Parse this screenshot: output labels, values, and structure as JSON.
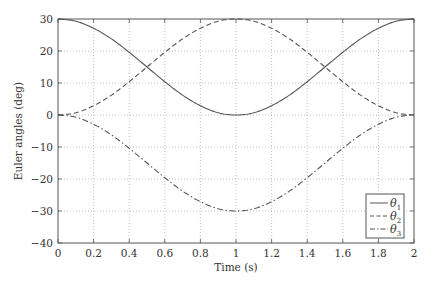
{
  "chart_data": {
    "type": "line",
    "title": "",
    "xlabel": "Time (s)",
    "ylabel": "Euler angles (deg)",
    "xlim": [
      0,
      2
    ],
    "ylim": [
      -40,
      30
    ],
    "grid": true,
    "legend_position": "lower right",
    "xticks": [
      0,
      0.2,
      0.4,
      0.6,
      0.8,
      1,
      1.2,
      1.4,
      1.6,
      1.8,
      2
    ],
    "xtick_labels": [
      "0",
      "0.2",
      "0.4",
      "0.6",
      "0.8",
      "1",
      "1.2",
      "1.4",
      "1.6",
      "1.8",
      "2"
    ],
    "yticks": [
      30,
      20,
      10,
      0,
      -10,
      -20,
      -30,
      -40
    ],
    "ytick_labels": [
      "30",
      "20",
      "10",
      "0",
      "−10",
      "−20",
      "−30",
      "−40"
    ],
    "x": [
      0,
      0.1,
      0.2,
      0.3,
      0.4,
      0.5,
      0.6,
      0.7,
      0.8,
      0.9,
      1.0,
      1.1,
      1.2,
      1.3,
      1.4,
      1.5,
      1.6,
      1.7,
      1.8,
      1.9,
      2.0
    ],
    "series": [
      {
        "name": "θ1",
        "style": "solid",
        "values": [
          30,
          29.3,
          27.1,
          23.8,
          19.6,
          15,
          10.4,
          6.2,
          2.9,
          0.7,
          0,
          0.7,
          2.9,
          6.2,
          10.4,
          15,
          19.6,
          23.8,
          27.1,
          29.3,
          30
        ]
      },
      {
        "name": "θ2",
        "style": "dashed",
        "values": [
          0,
          0.7,
          2.9,
          6.2,
          10.4,
          15,
          19.6,
          23.8,
          27.1,
          29.3,
          30,
          29.3,
          27.1,
          23.8,
          19.6,
          15,
          10.4,
          6.2,
          2.9,
          0.7,
          0
        ]
      },
      {
        "name": "θ3",
        "style": "dashdot",
        "values": [
          0,
          -0.7,
          -2.9,
          -6.2,
          -10.4,
          -15,
          -19.6,
          -23.8,
          -27.1,
          -29.3,
          -30,
          -29.3,
          -27.1,
          -23.8,
          -19.6,
          -15,
          -10.4,
          -6.2,
          -2.9,
          -0.7,
          0
        ]
      }
    ]
  },
  "legend": {
    "items": [
      {
        "symbol": "θ",
        "sub": "1"
      },
      {
        "symbol": "θ",
        "sub": "2"
      },
      {
        "symbol": "θ",
        "sub": "3"
      }
    ]
  }
}
